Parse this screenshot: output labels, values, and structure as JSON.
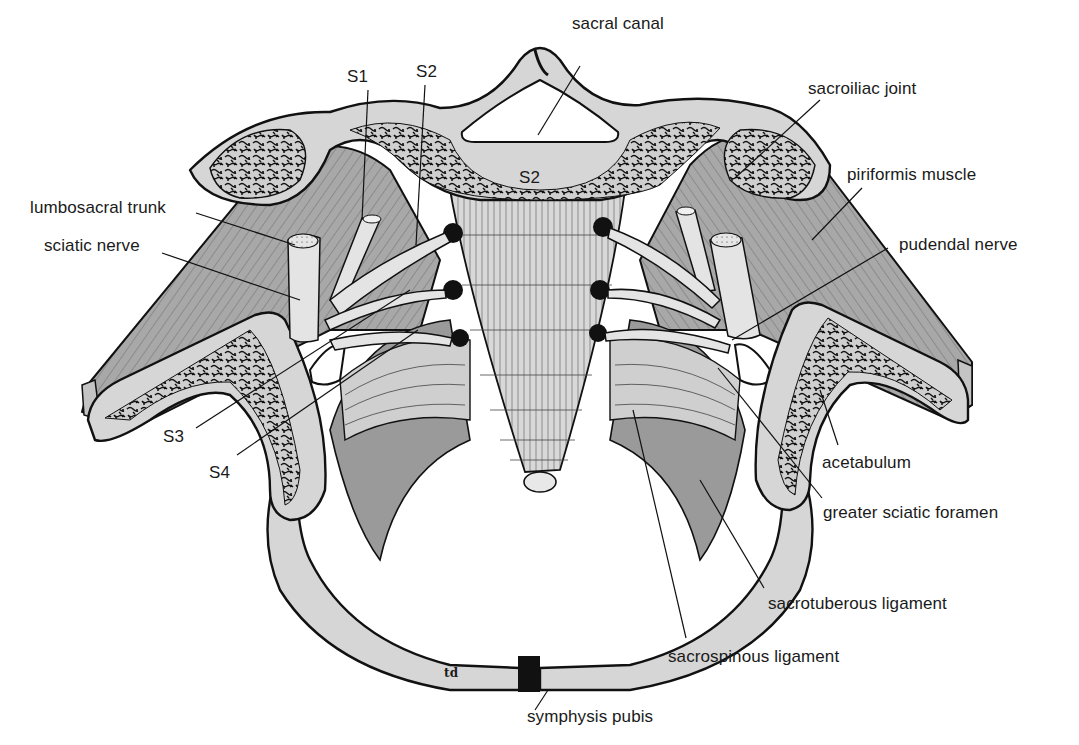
{
  "diagram": {
    "colors": {
      "background": "#ffffff",
      "bone": "#d6d6d6",
      "cancellous_bone": "#c9c9c9",
      "muscle": "#9a9a9a",
      "ligament": "#cfcfcf",
      "nerve": "#e4e4e4",
      "outline": "#111111"
    },
    "labels": {
      "sacral_canal": "sacral canal",
      "s1": "S1",
      "s2": "S2",
      "s2_vertebra": "S2",
      "sacroiliac_joint": "sacroiliac joint",
      "piriformis_muscle": "piriformis muscle",
      "lumbosacral_trunk": "lumbosacral trunk",
      "sciatic_nerve": "sciatic nerve",
      "pudendal_nerve": "pudendal nerve",
      "s3": "S3",
      "s4": "S4",
      "acetabulum": "acetabulum",
      "greater_sciatic_foramen": "greater sciatic foramen",
      "sacrotuberous_ligament": "sacrotuberous ligament",
      "sacrospinous_ligament": "sacrospinous ligament",
      "symphysis_pubis": "symphysis pubis",
      "artist_signature": "td"
    }
  }
}
